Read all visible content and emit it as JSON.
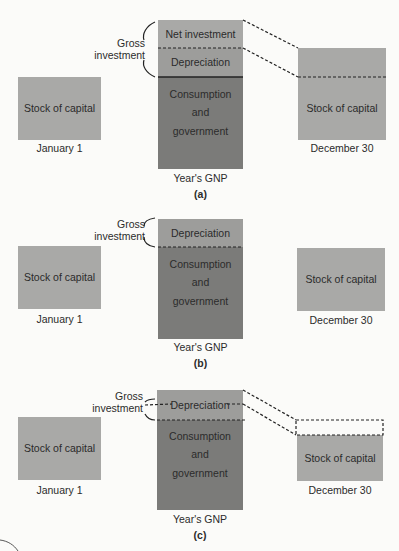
{
  "colors": {
    "stock_of_capital": "#a9a9a7",
    "net_investment": "#a9a9a7",
    "depreciation": "#9d9d9b",
    "consumption_government": "#7b7b79",
    "background": "#fbfbf9"
  },
  "panels": [
    {
      "tag": "(a)",
      "jan_box": "Stock of capital",
      "jan_label": "January 1",
      "gross_label": "Gross investment",
      "gross_line1": "Gross",
      "gross_line2": "investment",
      "gnp_segments": {
        "net_investment": "Net investment",
        "depreciation": "Depreciation",
        "cons_line1": "Consumption",
        "cons_line2": "and",
        "cons_line3": "government"
      },
      "gnp_label": "Year's GNP",
      "dec_box": "Stock of capital",
      "dec_label": "December 30"
    },
    {
      "tag": "(b)",
      "jan_box": "Stock of capital",
      "jan_label": "January 1",
      "gross_line1": "Gross",
      "gross_line2": "investment",
      "gnp_segments": {
        "depreciation": "Depreciation",
        "cons_line1": "Consumption",
        "cons_line2": "and",
        "cons_line3": "government"
      },
      "gnp_label": "Year's GNP",
      "dec_box": "Stock of capital",
      "dec_label": "December 30"
    },
    {
      "tag": "(c)",
      "jan_box": "Stock of capital",
      "jan_label": "January 1",
      "gross_line1": "Gross",
      "gross_line2": "investment",
      "gnp_segments": {
        "depreciation": "Depreciation",
        "cons_line1": "Consumption",
        "cons_line2": "and",
        "cons_line3": "government"
      },
      "gnp_label": "Year's GNP",
      "dec_box": "Stock of capital",
      "dec_label": "December 30"
    }
  ]
}
